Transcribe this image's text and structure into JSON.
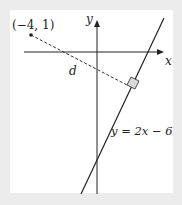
{
  "diagram": {
    "point_label": "(−4, 1)",
    "distance_label": "d",
    "x_axis_label": "x",
    "y_axis_label": "y",
    "line_label": "y = 2x − 6",
    "colors": {
      "background": "#ececec",
      "panel": "#ffffff",
      "stroke": "#222222",
      "right_angle_fill": "#d9d9d9"
    }
  }
}
